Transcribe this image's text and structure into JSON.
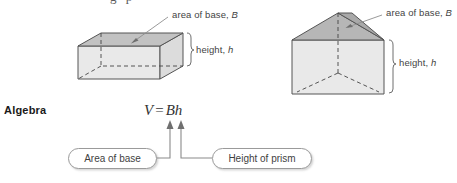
{
  "page": {
    "section_label": "Algebra",
    "partial_top_text": "g    p"
  },
  "formula": {
    "variable": "V",
    "equals": "=",
    "expression": "Bh",
    "full": "V = Bh"
  },
  "figures": [
    {
      "name": "rectangular-prism",
      "base_label": "area of base, ",
      "base_symbol": "B",
      "height_label": "height, ",
      "height_symbol": "h",
      "top_face_color": "#c2c2c2",
      "front_face_color": "#e9e9e9",
      "side_face_color": "#dcdcdc",
      "outline_color": "#555555"
    },
    {
      "name": "triangular-prism",
      "base_label": "area of base, ",
      "base_symbol": "B",
      "height_label": "height, ",
      "height_symbol": "h",
      "top_face_color": "#b6b6b6",
      "front_face_color": "#e9e9e9",
      "side_face_color": "#d2d2d2",
      "outline_color": "#555555"
    }
  ],
  "callouts": {
    "left_label": "Area of base",
    "right_label": "Height of prism"
  },
  "colors": {
    "text": "#3f3f3f",
    "heading": "#1a1a1a",
    "stroke": "#7a7a7a",
    "box_border": "#9a9a9a",
    "leader_line": "#9a9a9a"
  }
}
